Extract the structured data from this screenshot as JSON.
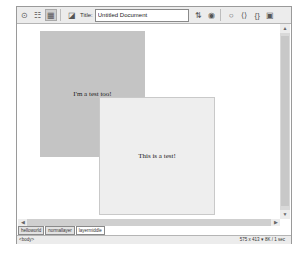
{
  "toolbar": {
    "title_label": "Title:",
    "title_value": "Untitled Document",
    "icons": [
      "code-view-icon",
      "split-view-icon",
      "design-view-icon",
      "live-data-icon",
      "file-management-icon",
      "preview-icon",
      "refresh-icon",
      "view-options-icon",
      "braces-icon",
      "layers-icon"
    ]
  },
  "canvas": {
    "box1_text": "I'm a test too!",
    "box2_text": "This is a test!"
  },
  "tabs": [
    {
      "label": "helloworld"
    },
    {
      "label": "normallayer"
    },
    {
      "label": "layermiddle"
    }
  ],
  "status": {
    "tag": "<body>",
    "size": "575 x 413 ▾ 8K / 1 sec"
  },
  "colors": {
    "box1_bg": "#c4c4c4",
    "box2_bg": "#eeeeee"
  }
}
